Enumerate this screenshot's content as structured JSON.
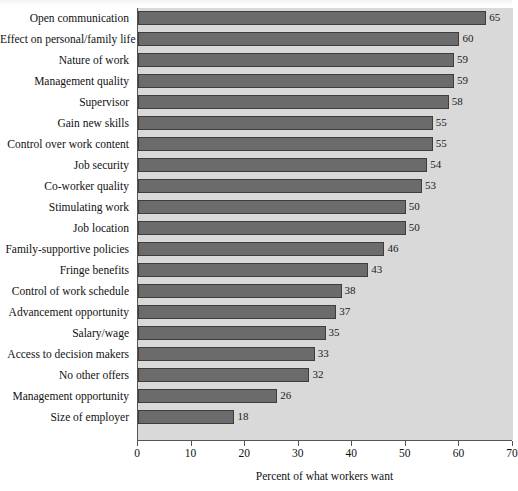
{
  "chart_data": {
    "type": "bar",
    "orientation": "horizontal",
    "title": "",
    "xlabel": "Percent of what workers want",
    "ylabel": "",
    "xlim": [
      0,
      70
    ],
    "xticks": [
      0,
      10,
      20,
      30,
      40,
      50,
      60,
      70
    ],
    "grid": false,
    "legend": "none",
    "bar_color": "#6b6b6b",
    "bar_edge_color": "#3d3d3d",
    "plot_background": "#d9d9d9",
    "categories": [
      "Open communication",
      "Effect on personal/family life",
      "Nature of work",
      "Management quality",
      "Supervisor",
      "Gain new skills",
      "Control over work content",
      "Job security",
      "Co-worker quality",
      "Stimulating work",
      "Job location",
      "Family-supportive policies",
      "Fringe benefits",
      "Control of work schedule",
      "Advancement opportunity",
      "Salary/wage",
      "Access to decision makers",
      "No other offers",
      "Management opportunity",
      "Size of employer"
    ],
    "values": [
      65,
      60,
      59,
      59,
      58,
      55,
      55,
      54,
      53,
      50,
      50,
      46,
      43,
      38,
      37,
      35,
      33,
      32,
      26,
      18
    ],
    "value_labels": [
      "65",
      "60",
      "59",
      "59",
      "58",
      "55",
      "55",
      "54",
      "53",
      "50",
      "50",
      "46",
      "43",
      "38",
      "37",
      "35",
      "33",
      "32",
      "26",
      "18"
    ],
    "xtick_labels": [
      "0",
      "10",
      "20",
      "30",
      "40",
      "50",
      "60",
      "70"
    ]
  }
}
